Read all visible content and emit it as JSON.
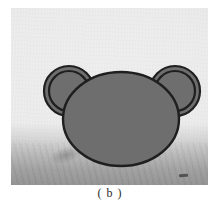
{
  "figure": {
    "caption": "( b )",
    "subfigure_label": "b",
    "photo": {
      "background_color": "#ececec",
      "shadow_band_color": "#7a7a7a",
      "border_color": "#d9d9d9"
    },
    "drawing": {
      "description": "Outlined bear-head shape: one large ellipse with two concentric ring ears",
      "fill_color": "#6e6e6e",
      "outline_color": "#1f1f1f",
      "outline_width": 2,
      "shapes": [
        {
          "name": "left-ear",
          "type": "ring",
          "cx": 58,
          "cy": 83,
          "r_outer": 25,
          "r_inner": 20,
          "fill": "#6e6e6e"
        },
        {
          "name": "right-ear",
          "type": "ring",
          "cx": 164,
          "cy": 83,
          "r_outer": 25,
          "r_inner": 20,
          "fill": "#6e6e6e"
        },
        {
          "name": "head",
          "type": "ellipse",
          "cx": 110,
          "cy": 111,
          "rx": 58,
          "ry": 47,
          "fill": "#6e6e6e"
        }
      ]
    }
  }
}
